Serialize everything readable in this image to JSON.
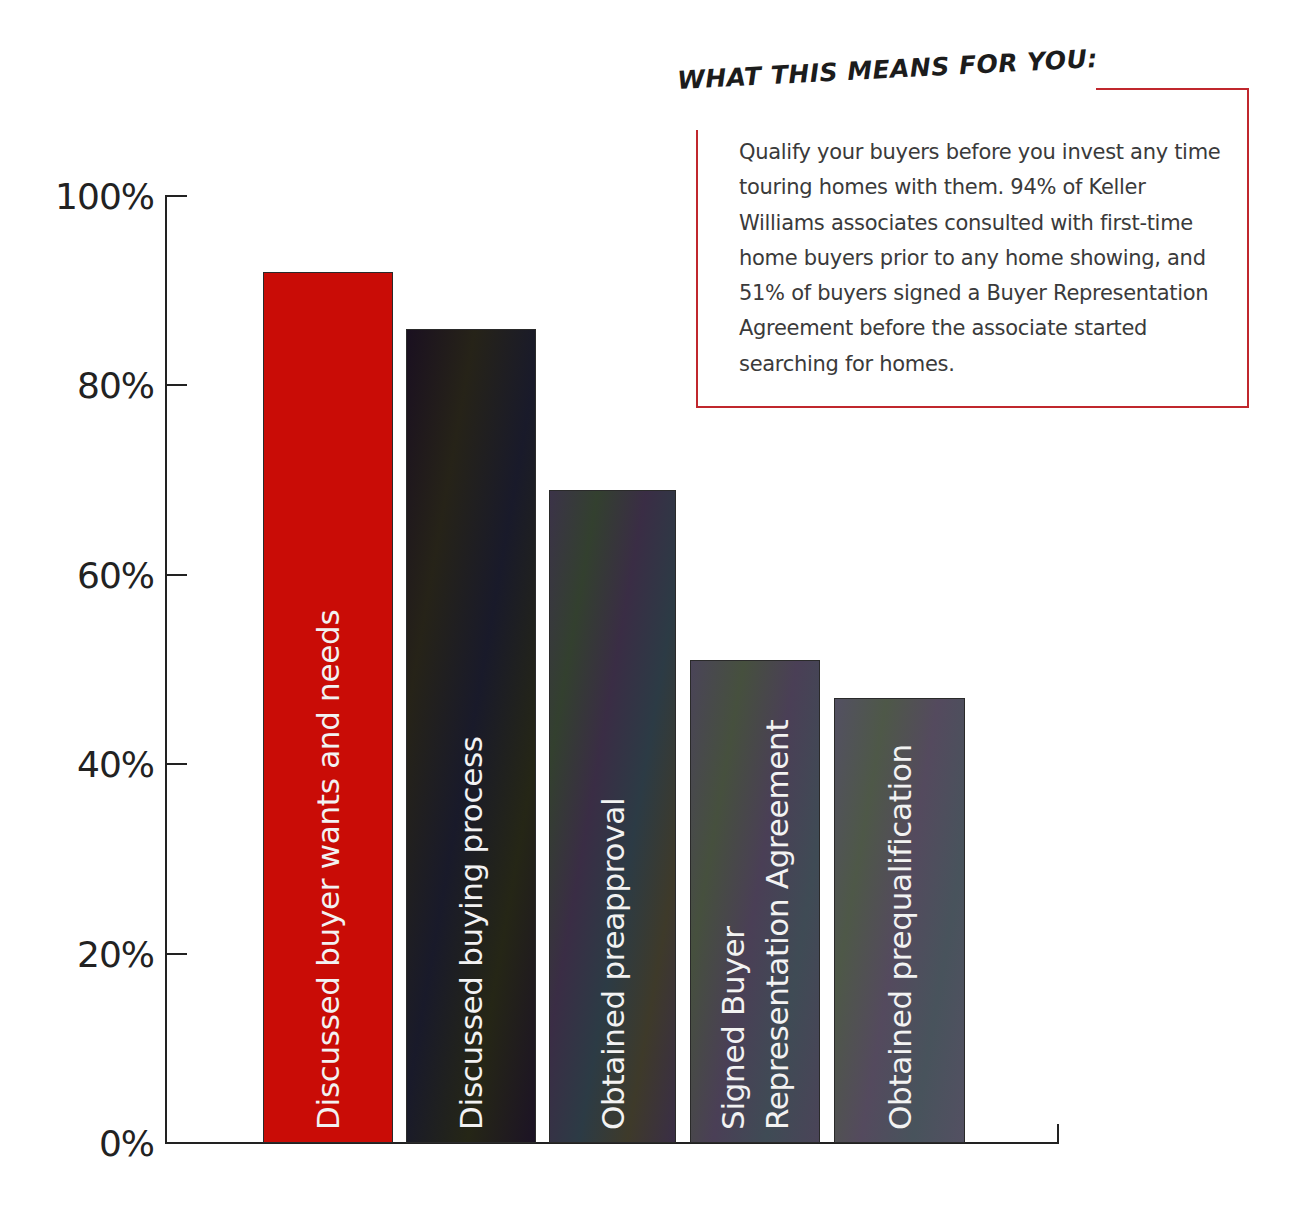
{
  "callout": {
    "title": "WHAT THIS MEANS FOR YOU:",
    "body": "Qualify your buyers before you invest any time touring homes with them. 94% of Keller Williams associates consulted with first-time home buyers prior to any home showing, and 51% of buyers signed a Buyer Representation Agreement before the associate started searching for homes.",
    "border_color": "#c0272d"
  },
  "y_axis": {
    "ticks": [
      "0%",
      "20%",
      "40%",
      "60%",
      "80%",
      "100%"
    ]
  },
  "bars": [
    {
      "label": "Discussed buyer wants and needs",
      "value": 92,
      "color": "#c90c06"
    },
    {
      "label": "Discussed buying process",
      "value": 86,
      "color": "#1c1a20"
    },
    {
      "label": "Obtained preapproval",
      "value": 69,
      "color": "#3a3444"
    },
    {
      "label": "Signed Buyer\nRepresentation Agreement",
      "value": 51,
      "color": "#4a4656"
    },
    {
      "label": "Obtained prequalification",
      "value": 47,
      "color": "#525060"
    }
  ],
  "chart_data": {
    "type": "bar",
    "title": "",
    "categories": [
      "Discussed buyer wants and needs",
      "Discussed buying process",
      "Obtained preapproval",
      "Signed Buyer Representation Agreement",
      "Obtained prequalification"
    ],
    "values": [
      92,
      86,
      69,
      51,
      47
    ],
    "xlabel": "",
    "ylabel": "",
    "ylim": [
      0,
      100
    ],
    "yticks": [
      "0%",
      "20%",
      "40%",
      "60%",
      "80%",
      "100%"
    ],
    "grid": false,
    "legend": "none",
    "colors": [
      "#c90c06",
      "#1c1a20",
      "#3a3444",
      "#4a4656",
      "#525060"
    ],
    "annotations": [
      {
        "title": "WHAT THIS MEANS FOR YOU:",
        "text": "Qualify your buyers before you invest any time touring homes with them. 94% of Keller Williams associates consulted with first-time home buyers prior to any home showing, and 51% of buyers signed a Buyer Representation Agreement before the associate started searching for homes.",
        "position": "top-right"
      }
    ]
  }
}
